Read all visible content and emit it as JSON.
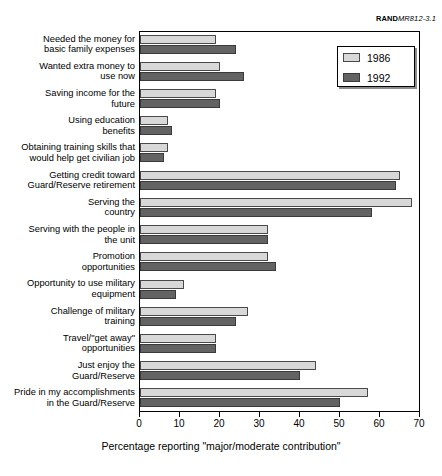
{
  "figure": {
    "rand_prefix": "RAND",
    "rand_id": "MR812-3.1"
  },
  "legend": {
    "position": "top-right",
    "items": [
      {
        "label": "1986",
        "color": "#d8d8d8"
      },
      {
        "label": "1992",
        "color": "#636363"
      }
    ]
  },
  "chart_data": {
    "type": "bar",
    "orientation": "horizontal",
    "title": "",
    "subtitle": "",
    "xlabel": "Percentage reporting \"major/moderate contribution\"",
    "ylabel": "",
    "xlim": [
      0,
      70
    ],
    "xticks": [
      0,
      10,
      20,
      30,
      40,
      50,
      60,
      70
    ],
    "xtick_labels": [
      "0",
      "10",
      "20",
      "30",
      "40",
      "50",
      "60",
      "70"
    ],
    "grid": false,
    "legend_position": "top-right",
    "categories": [
      "Needed the money for basic family expenses",
      "Wanted extra money to use now",
      "Saving income for the future",
      "Using education benefits",
      "Obtaining training skills that would help get civilian job",
      "Getting credit toward Guard/Reserve retirement",
      "Serving the country",
      "Serving with the people in the unit",
      "Promotion opportunities",
      "Opportunity to use military equipment",
      "Challenge of military training",
      "Travel/\"get away\" opportunities",
      "Just enjoy the Guard/Reserve",
      "Pride in my accomplishments in the Guard/Reserve"
    ],
    "category_lines": [
      [
        "Needed the money for",
        "basic family expenses"
      ],
      [
        "Wanted extra money to",
        "use now"
      ],
      [
        "Saving income for the",
        "future"
      ],
      [
        "Using education",
        "benefits"
      ],
      [
        "Obtaining training skills that",
        "would help get civilian job"
      ],
      [
        "Getting credit toward",
        "Guard/Reserve retirement"
      ],
      [
        "Serving the",
        "country"
      ],
      [
        "Serving with the people in",
        "the unit"
      ],
      [
        "Promotion",
        "opportunities"
      ],
      [
        "Opportunity to use military",
        "equipment"
      ],
      [
        "Challenge of military",
        "training"
      ],
      [
        "Travel/\"get away\"",
        "opportunities"
      ],
      [
        "Just enjoy the",
        "Guard/Reserve"
      ],
      [
        "Pride in my accomplishments",
        "in the Guard/Reserve"
      ]
    ],
    "series": [
      {
        "name": "1986",
        "color": "#d8d8d8",
        "values": [
          19,
          20,
          19,
          7,
          7,
          65,
          68,
          32,
          32,
          11,
          27,
          19,
          44,
          57
        ]
      },
      {
        "name": "1992",
        "color": "#636363",
        "values": [
          24,
          26,
          20,
          8,
          6,
          64,
          58,
          32,
          34,
          9,
          24,
          19,
          40,
          50
        ]
      }
    ]
  }
}
